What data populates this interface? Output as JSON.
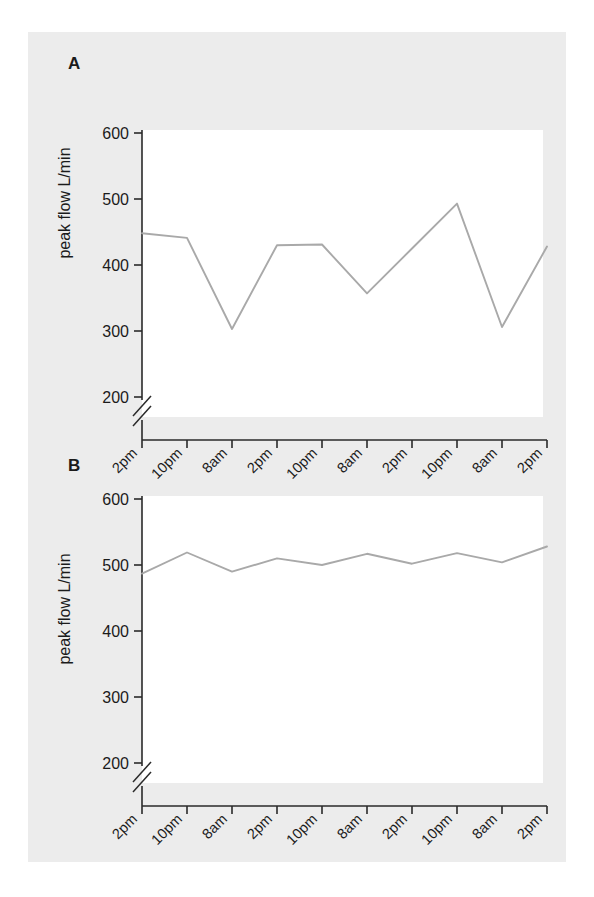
{
  "figure": {
    "background_color": "#ececec",
    "page_color": "#ffffff",
    "line_color": "#a9a9a9",
    "axis_color": "#2a2a2a"
  },
  "panels": [
    {
      "letter": "A",
      "ylabel": "peak flow L/min"
    },
    {
      "letter": "B",
      "ylabel": "peak flow L/min"
    }
  ],
  "chart_data": [
    {
      "type": "line",
      "title": "A",
      "xlabel": "",
      "ylabel": "peak flow L/min",
      "ylim": [
        200,
        600
      ],
      "yticks": [
        200,
        300,
        400,
        500,
        600
      ],
      "axis_break": true,
      "axis_break_below": 200,
      "grid": false,
      "legend": "none",
      "categories": [
        "2pm",
        "10pm",
        "8am",
        "2pm",
        "10pm",
        "8am",
        "2pm",
        "10pm",
        "8am",
        "2pm"
      ],
      "values": [
        448,
        441,
        303,
        430,
        431,
        357,
        425,
        493,
        306,
        428
      ],
      "line_color": "#a9a9a9"
    },
    {
      "type": "line",
      "title": "B",
      "xlabel": "",
      "ylabel": "peak flow L/min",
      "ylim": [
        200,
        600
      ],
      "yticks": [
        200,
        300,
        400,
        500,
        600
      ],
      "axis_break": true,
      "axis_break_below": 200,
      "grid": false,
      "legend": "none",
      "categories": [
        "2pm",
        "10pm",
        "8am",
        "2pm",
        "10pm",
        "8am",
        "2pm",
        "10pm",
        "8am",
        "2pm"
      ],
      "values": [
        487,
        519,
        490,
        510,
        500,
        517,
        502,
        518,
        504,
        528
      ],
      "line_color": "#a9a9a9"
    }
  ],
  "axes": {
    "ytick_labels": [
      "600",
      "500",
      "400",
      "300",
      "200"
    ],
    "xtick_labels": [
      "2pm",
      "10pm",
      "8am",
      "2pm",
      "10pm",
      "8am",
      "2pm",
      "10pm",
      "8am",
      "2pm"
    ]
  }
}
